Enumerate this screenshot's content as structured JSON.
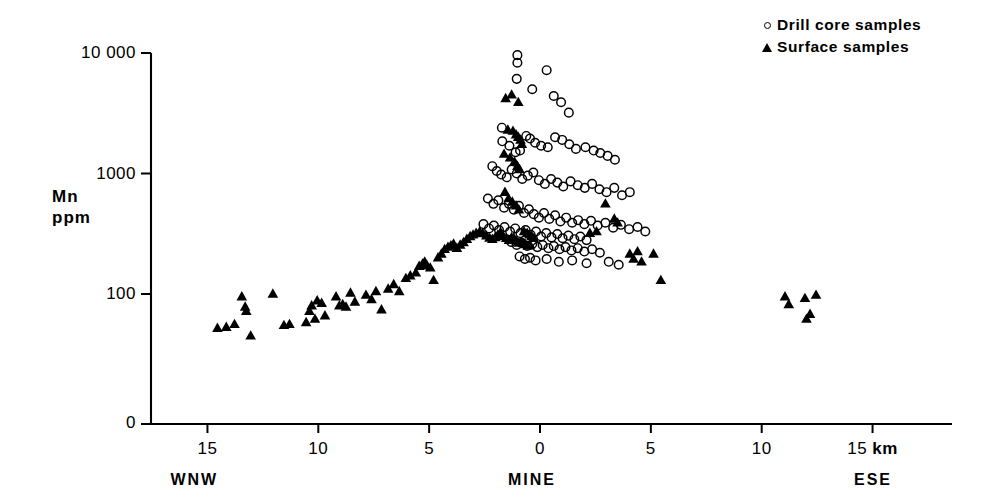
{
  "chart_data": {
    "type": "scatter",
    "title": "",
    "subtitle": "",
    "xlabel": "",
    "ylabel": "Mn\nppm",
    "ylabel_lines": [
      "Mn",
      "ppm"
    ],
    "x_unit": "km",
    "yscale": "log",
    "xscale": "linear",
    "grid": false,
    "xlim": [
      -16.0,
      16.5
    ],
    "ylim": [
      30,
      14000
    ],
    "y_axis_break_at_zero": true,
    "xticks": [
      -15,
      -10,
      -5,
      0,
      5,
      10,
      15
    ],
    "xtick_labels": [
      "15",
      "10",
      "5",
      "0",
      "5",
      "10",
      "15 km"
    ],
    "yticks": [
      100,
      1000,
      10000
    ],
    "ytick_labels": [
      "100",
      "1000",
      "10 000"
    ],
    "y_origin_label": "0",
    "axis_annotations": [
      {
        "name": "left-direction",
        "text": "WNW",
        "x": -15.0
      },
      {
        "name": "center-direction",
        "text": "MINE",
        "x": 0.0
      },
      {
        "name": "right-direction",
        "text": "ESE",
        "x": 15.2
      }
    ],
    "legend": {
      "position": "top-right",
      "entries": [
        {
          "marker": "open-circle",
          "label": "Drill core samples"
        },
        {
          "marker": "filled-triangle",
          "label": "Surface samples"
        }
      ]
    },
    "series": [
      {
        "name": "Drill core samples",
        "marker": "open-circle",
        "color": "#000000",
        "fill": "none",
        "points": [
          [
            -1.02,
            9600
          ],
          [
            -1.02,
            8300
          ],
          [
            -1.05,
            6100
          ],
          [
            -0.35,
            5000
          ],
          [
            0.3,
            7200
          ],
          [
            0.62,
            4400
          ],
          [
            0.95,
            3900
          ],
          [
            1.3,
            3200
          ],
          [
            -1.72,
            2400
          ],
          [
            -1.7,
            1850
          ],
          [
            -1.38,
            1700
          ],
          [
            -1.1,
            1500
          ],
          [
            -0.9,
            1550
          ],
          [
            -0.62,
            2050
          ],
          [
            -0.45,
            1950
          ],
          [
            -0.22,
            1800
          ],
          [
            0.05,
            1700
          ],
          [
            0.35,
            1650
          ],
          [
            0.68,
            2000
          ],
          [
            1.0,
            1900
          ],
          [
            1.32,
            1750
          ],
          [
            1.62,
            1600
          ],
          [
            2.05,
            1650
          ],
          [
            2.42,
            1550
          ],
          [
            2.72,
            1480
          ],
          [
            3.05,
            1400
          ],
          [
            3.38,
            1300
          ],
          [
            -2.15,
            1150
          ],
          [
            -1.95,
            1050
          ],
          [
            -1.75,
            980
          ],
          [
            -1.5,
            930
          ],
          [
            -1.28,
            1080
          ],
          [
            -1.05,
            1000
          ],
          [
            -0.8,
            900
          ],
          [
            -0.55,
            960
          ],
          [
            -0.3,
            1020
          ],
          [
            -0.05,
            880
          ],
          [
            0.22,
            820
          ],
          [
            0.5,
            900
          ],
          [
            0.78,
            840
          ],
          [
            1.05,
            780
          ],
          [
            1.38,
            860
          ],
          [
            1.7,
            800
          ],
          [
            2.02,
            760
          ],
          [
            2.35,
            820
          ],
          [
            2.68,
            740
          ],
          [
            3.0,
            700
          ],
          [
            3.35,
            760
          ],
          [
            3.7,
            660
          ],
          [
            4.05,
            700
          ],
          [
            -2.35,
            620
          ],
          [
            -2.1,
            560
          ],
          [
            -1.88,
            600
          ],
          [
            -1.62,
            520
          ],
          [
            -1.4,
            560
          ],
          [
            -1.18,
            500
          ],
          [
            -0.95,
            540
          ],
          [
            -0.72,
            470
          ],
          [
            -0.5,
            505
          ],
          [
            -0.28,
            460
          ],
          [
            -0.05,
            430
          ],
          [
            0.18,
            470
          ],
          [
            0.42,
            420
          ],
          [
            0.68,
            450
          ],
          [
            0.92,
            400
          ],
          [
            1.18,
            430
          ],
          [
            1.45,
            390
          ],
          [
            1.72,
            410
          ],
          [
            2.0,
            380
          ],
          [
            2.3,
            405
          ],
          [
            2.6,
            370
          ],
          [
            2.95,
            390
          ],
          [
            3.3,
            355
          ],
          [
            3.65,
            375
          ],
          [
            4.02,
            345
          ],
          [
            4.4,
            360
          ],
          [
            4.75,
            330
          ],
          [
            -2.55,
            380
          ],
          [
            -2.3,
            350
          ],
          [
            -2.08,
            370
          ],
          [
            -1.85,
            340
          ],
          [
            -1.6,
            360
          ],
          [
            -1.35,
            330
          ],
          [
            -1.12,
            350
          ],
          [
            -0.88,
            320
          ],
          [
            -0.65,
            340
          ],
          [
            -0.42,
            310
          ],
          [
            -0.18,
            330
          ],
          [
            0.05,
            300
          ],
          [
            0.28,
            320
          ],
          [
            0.52,
            295
          ],
          [
            0.78,
            315
          ],
          [
            1.02,
            290
          ],
          [
            1.28,
            305
          ],
          [
            1.55,
            285
          ],
          [
            1.82,
            300
          ],
          [
            2.1,
            280
          ],
          [
            -1.3,
            270
          ],
          [
            -1.05,
            255
          ],
          [
            -0.82,
            265
          ],
          [
            -0.58,
            250
          ],
          [
            -0.35,
            260
          ],
          [
            -0.12,
            245
          ],
          [
            0.12,
            255
          ],
          [
            0.38,
            240
          ],
          [
            0.62,
            250
          ],
          [
            0.88,
            235
          ],
          [
            1.15,
            245
          ],
          [
            1.42,
            230
          ],
          [
            1.7,
            240
          ],
          [
            2.0,
            225
          ],
          [
            2.35,
            235
          ],
          [
            2.7,
            220
          ],
          [
            -0.92,
            205
          ],
          [
            -0.68,
            195
          ],
          [
            -0.45,
            200
          ],
          [
            -0.2,
            190
          ],
          [
            0.3,
            195
          ],
          [
            0.85,
            185
          ],
          [
            1.45,
            190
          ],
          [
            2.1,
            180
          ],
          [
            3.1,
            185
          ],
          [
            3.55,
            175
          ]
        ]
      },
      {
        "name": "Surface samples",
        "marker": "filled-triangle",
        "color": "#000000",
        "fill": "#000000",
        "points": [
          [
            -14.55,
            52
          ],
          [
            -14.15,
            53
          ],
          [
            -13.78,
            56
          ],
          [
            -13.45,
            95
          ],
          [
            -13.3,
            78
          ],
          [
            -13.25,
            72
          ],
          [
            -13.05,
            45
          ],
          [
            -12.05,
            100
          ],
          [
            -11.55,
            55
          ],
          [
            -11.3,
            56
          ],
          [
            -10.55,
            58
          ],
          [
            -10.4,
            72
          ],
          [
            -10.3,
            80
          ],
          [
            -10.15,
            62
          ],
          [
            -10.05,
            88
          ],
          [
            -9.85,
            84
          ],
          [
            -9.7,
            66
          ],
          [
            -9.2,
            95
          ],
          [
            -9.05,
            80
          ],
          [
            -8.9,
            82
          ],
          [
            -8.75,
            78
          ],
          [
            -8.55,
            102
          ],
          [
            -8.35,
            86
          ],
          [
            -7.85,
            98
          ],
          [
            -7.6,
            90
          ],
          [
            -7.4,
            105
          ],
          [
            -7.15,
            74
          ],
          [
            -6.85,
            110
          ],
          [
            -6.6,
            120
          ],
          [
            -6.35,
            105
          ],
          [
            -6.05,
            135
          ],
          [
            -5.85,
            142
          ],
          [
            -5.6,
            150
          ],
          [
            -5.45,
            170
          ],
          [
            -5.3,
            178
          ],
          [
            -5.2,
            185
          ],
          [
            -5.1,
            172
          ],
          [
            -4.95,
            165
          ],
          [
            -4.8,
            130
          ],
          [
            -4.6,
            200
          ],
          [
            -4.45,
            215
          ],
          [
            -4.3,
            235
          ],
          [
            -4.15,
            245
          ],
          [
            -4.02,
            252
          ],
          [
            -3.9,
            260
          ],
          [
            -3.75,
            240
          ],
          [
            -3.6,
            255
          ],
          [
            -3.45,
            268
          ],
          [
            -3.3,
            285
          ],
          [
            -3.15,
            300
          ],
          [
            -3.02,
            310
          ],
          [
            -2.88,
            320
          ],
          [
            -2.72,
            330
          ],
          [
            -2.58,
            318
          ],
          [
            -2.42,
            305
          ],
          [
            -2.28,
            292
          ],
          [
            -2.15,
            285
          ],
          [
            -2.02,
            295
          ],
          [
            -1.9,
            310
          ],
          [
            -1.78,
            325
          ],
          [
            -1.65,
            300
          ],
          [
            -1.52,
            290
          ],
          [
            -1.4,
            280
          ],
          [
            -1.28,
            295
          ],
          [
            -1.15,
            285
          ],
          [
            -1.05,
            275
          ],
          [
            -0.95,
            265
          ],
          [
            -0.85,
            270
          ],
          [
            -0.75,
            262
          ],
          [
            -0.65,
            258
          ],
          [
            -0.55,
            250
          ],
          [
            -0.45,
            255
          ],
          [
            -1.55,
            4200
          ],
          [
            -1.28,
            4500
          ],
          [
            -0.98,
            3900
          ],
          [
            -1.45,
            2300
          ],
          [
            -1.22,
            2250
          ],
          [
            -1.08,
            2100
          ],
          [
            -0.98,
            2000
          ],
          [
            -0.88,
            1900
          ],
          [
            -0.82,
            1750
          ],
          [
            -1.62,
            1450
          ],
          [
            -1.35,
            1350
          ],
          [
            -1.15,
            1250
          ],
          [
            -1.02,
            1150
          ],
          [
            -0.92,
            1080
          ],
          [
            -1.58,
            700
          ],
          [
            -1.42,
            620
          ],
          [
            -1.25,
            580
          ],
          [
            -1.08,
            540
          ],
          [
            -0.95,
            500
          ],
          [
            -0.72,
            330
          ],
          [
            -0.58,
            320
          ],
          [
            -0.48,
            310
          ],
          [
            -0.38,
            300
          ],
          [
            -0.28,
            290
          ],
          [
            2.95,
            560
          ],
          [
            3.35,
            420
          ],
          [
            3.5,
            390
          ],
          [
            2.55,
            330
          ],
          [
            2.25,
            320
          ],
          [
            4.05,
            215
          ],
          [
            4.22,
            195
          ],
          [
            4.4,
            225
          ],
          [
            4.58,
            185
          ],
          [
            5.12,
            215
          ],
          [
            5.45,
            130
          ],
          [
            11.05,
            95
          ],
          [
            11.22,
            82
          ],
          [
            11.95,
            92
          ],
          [
            12.02,
            62
          ],
          [
            12.18,
            68
          ],
          [
            12.45,
            98
          ]
        ]
      }
    ]
  },
  "legend": {
    "drill_core_label": "Drill core samples",
    "surface_label": "Surface samples"
  },
  "axis": {
    "y_label_line1": "Mn",
    "y_label_line2": "ppm",
    "y_zero": "0",
    "y_100": "100",
    "y_1000": "1000",
    "y_10000": "10 000",
    "x_15_left": "15",
    "x_10_left": "10",
    "x_5_left": "5",
    "x_0": "0",
    "x_5_right": "5",
    "x_10_right": "10",
    "x_15_right": "15",
    "x_km_unit": "km",
    "dir_left": "WNW",
    "dir_center": "MINE",
    "dir_right": "ESE"
  },
  "colors": {
    "axis": "#000000",
    "marker": "#000000",
    "background": "#ffffff"
  }
}
